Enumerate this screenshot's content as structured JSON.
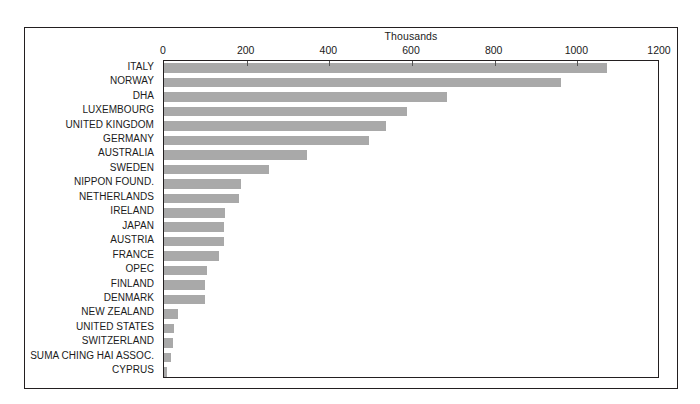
{
  "chart_data": {
    "type": "bar",
    "orientation": "horizontal",
    "title": "Thousands",
    "xlabel": "Thousands",
    "ylabel": "",
    "xlim": [
      0,
      1200
    ],
    "xticks": [
      0,
      200,
      400,
      600,
      800,
      1000,
      1200
    ],
    "xtick_labels": [
      "0",
      "200",
      "400",
      "600",
      "800",
      "1000",
      "1200"
    ],
    "grid": false,
    "legend": null,
    "axis_position": "top",
    "bar_color": "#a9a9a9",
    "categories": [
      "ITALY",
      "NORWAY",
      "DHA",
      "LUXEMBOURG",
      "UNITED KINGDOM",
      "GERMANY",
      "AUSTRALIA",
      "SWEDEN",
      "NIPPON FOUND.",
      "NETHERLANDS",
      "IRELAND",
      "JAPAN",
      "AUSTRIA",
      "FRANCE",
      "OPEC",
      "FINLAND",
      "DENMARK",
      "NEW ZEALAND",
      "UNITED STATES",
      "SWITZERLAND",
      "SUMA CHING HAI ASSOC.",
      "CYPRUS"
    ],
    "values": [
      1071,
      960,
      684,
      589,
      536,
      495,
      347,
      254,
      187,
      181,
      147,
      146,
      146,
      134,
      104,
      100,
      100,
      33,
      23,
      22,
      18,
      8
    ]
  }
}
